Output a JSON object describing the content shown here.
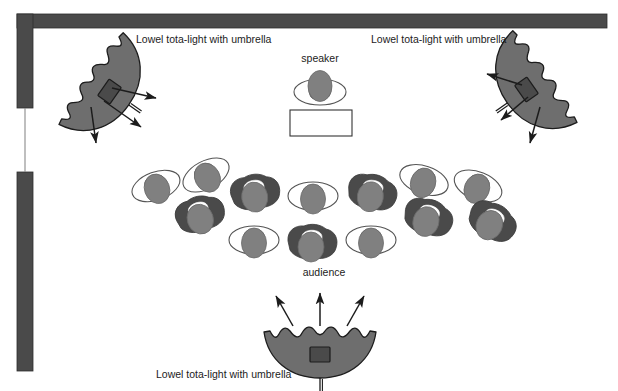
{
  "diagram": {
    "type": "floor-plan",
    "canvas": {
      "width": 618,
      "height": 391,
      "background": "#ffffff"
    },
    "colors": {
      "wall": "#4a4a4a",
      "umbrella_fill": "#6e6e6e",
      "umbrella_stroke": "#1c1c1c",
      "lamp_head": "#4a4a4a",
      "person_head": "#808080",
      "person_shoulder_dark": "#4a4a4a",
      "person_outline": "#555555",
      "arrow": "#1c1c1c",
      "text": "#1c1c1c",
      "table_fill": "#ffffff",
      "table_stroke": "#333333"
    },
    "labels": {
      "light_top_left": "Lowel tota-light with umbrella",
      "light_top_right": "Lowel tota-light with umbrella",
      "light_bottom": "Lowel tota-light with umbrella",
      "speaker": "speaker",
      "audience": "audience"
    },
    "walls": [
      {
        "name": "top-wall",
        "x": 17,
        "y": 14,
        "width": 590,
        "height": 14
      },
      {
        "name": "left-wall-upper",
        "x": 17,
        "y": 14,
        "width": 16,
        "height": 94
      },
      {
        "name": "left-wall-lower",
        "x": 17,
        "y": 172,
        "width": 16,
        "height": 199
      }
    ],
    "doorway": {
      "name": "doorway-gap",
      "x": 25,
      "y": 108,
      "height": 64
    },
    "lights": [
      {
        "name": "top-left-umbrella",
        "position": {
          "x": 96,
          "y": 82
        },
        "rotation_deg": 55,
        "beam_count": 3
      },
      {
        "name": "top-right-umbrella",
        "position": {
          "x": 540,
          "y": 80
        },
        "rotation_deg": -55,
        "beam_count": 3
      },
      {
        "name": "bottom-umbrella",
        "position": {
          "x": 320,
          "y": 338
        },
        "rotation_deg": 180,
        "beam_count": 3
      }
    ],
    "speaker_area": {
      "person": {
        "x": 318,
        "y": 87
      },
      "table": {
        "x": 290,
        "y": 110,
        "width": 62,
        "height": 26
      }
    },
    "audience": {
      "count": 13,
      "seats": [
        {
          "id": 1,
          "x": 156,
          "y": 186,
          "rot": -20,
          "style": "outline"
        },
        {
          "id": 2,
          "x": 206,
          "y": 175,
          "rot": -28,
          "style": "outline"
        },
        {
          "id": 3,
          "x": 200,
          "y": 215,
          "rot": -18,
          "style": "filled"
        },
        {
          "id": 4,
          "x": 255,
          "y": 193,
          "rot": -10,
          "style": "filled"
        },
        {
          "id": 5,
          "x": 254,
          "y": 240,
          "rot": 0,
          "style": "outline"
        },
        {
          "id": 6,
          "x": 313,
          "y": 196,
          "rot": 0,
          "style": "outline"
        },
        {
          "id": 7,
          "x": 312,
          "y": 243,
          "rot": 0,
          "style": "filled"
        },
        {
          "id": 8,
          "x": 372,
          "y": 193,
          "rot": 10,
          "style": "filled"
        },
        {
          "id": 9,
          "x": 371,
          "y": 240,
          "rot": 0,
          "style": "outline"
        },
        {
          "id": 10,
          "x": 424,
          "y": 180,
          "rot": 18,
          "style": "outline"
        },
        {
          "id": 11,
          "x": 428,
          "y": 218,
          "rot": 16,
          "style": "filled"
        },
        {
          "id": 12,
          "x": 478,
          "y": 186,
          "rot": 22,
          "style": "outline"
        },
        {
          "id": 13,
          "x": 492,
          "y": 222,
          "rot": 26,
          "style": "filled"
        }
      ]
    }
  }
}
